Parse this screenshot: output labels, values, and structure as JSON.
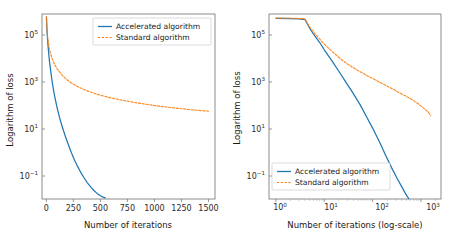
{
  "figure": {
    "background_color": "#ffffff",
    "width": 453,
    "height": 244,
    "panel_count": 2
  },
  "colors": {
    "accelerated": "#1f77b4",
    "standard": "#ff7f0e",
    "axis": "#7f7f7f",
    "text": "#1a1a1a"
  },
  "chart_data": [
    {
      "type": "line",
      "panel": "left",
      "title": "",
      "xlabel": "Number of iterations",
      "ylabel": "Logarithm of loss",
      "xscale": "linear",
      "yscale": "log",
      "xlim": [
        -40,
        1560
      ],
      "ylim": [
        0.012,
        1200000
      ],
      "xticks": [
        0,
        250,
        500,
        750,
        1000,
        1250,
        1500
      ],
      "xticklabels": [
        "0",
        "250",
        "500",
        "750",
        "1000",
        "1250",
        "1500"
      ],
      "yticks": [
        100000,
        1000,
        10,
        0.1
      ],
      "yticklabels": [
        "10^5",
        "10^3",
        "10^1",
        "10^-1"
      ],
      "grid": false,
      "legend_position": "upper right",
      "series": [
        {
          "name": "Accelerated algorithm",
          "style": "solid",
          "color": "#1f77b4",
          "x": [
            1,
            5,
            10,
            15,
            20,
            25,
            30,
            40,
            50,
            65,
            80,
            100,
            125,
            150,
            175,
            200,
            230,
            260,
            290,
            320,
            350,
            380,
            410,
            440,
            470,
            500,
            525,
            545
          ],
          "y": [
            900000,
            300000,
            120000,
            58000,
            30000,
            17000,
            10000,
            4200,
            1900,
            680,
            280,
            105,
            36,
            14.5,
            6.4,
            3.0,
            1.25,
            0.58,
            0.3,
            0.165,
            0.097,
            0.06,
            0.04,
            0.028,
            0.021,
            0.0165,
            0.0145,
            0.0135
          ]
        },
        {
          "name": "Standard algorithm",
          "style": "dashed",
          "color": "#ff7f0e",
          "x": [
            1,
            5,
            10,
            20,
            30,
            50,
            75,
            100,
            150,
            200,
            250,
            300,
            400,
            500,
            600,
            700,
            800,
            900,
            1000,
            1100,
            1200,
            1300,
            1400,
            1500
          ],
          "y": [
            900000,
            300000,
            145000,
            62000,
            34000,
            16000,
            8200,
            5100,
            2600,
            1600,
            1100,
            820,
            520,
            370,
            280,
            225,
            185,
            155,
            133,
            116,
            102,
            91,
            82,
            75
          ]
        }
      ]
    },
    {
      "type": "line",
      "panel": "right",
      "title": "",
      "xlabel": "Number of iterations (log-scale)",
      "ylabel": "Logarithm of loss",
      "xscale": "log",
      "yscale": "log",
      "xlim": [
        0.72,
        2600
      ],
      "ylim": [
        0.012,
        1200000
      ],
      "xticks": [
        1,
        10,
        100,
        1000
      ],
      "xticklabels": [
        "10^0",
        "10^1",
        "10^2",
        "10^3"
      ],
      "yticks": [
        100000,
        1000,
        10,
        0.1
      ],
      "yticklabels": [
        "10^5",
        "10^3",
        "10^1",
        "10^-1"
      ],
      "grid": false,
      "legend_position": "lower left",
      "series": [
        {
          "name": "Accelerated algorithm",
          "style": "solid",
          "color": "#1f77b4",
          "x": [
            1,
            2,
            3,
            4,
            5,
            6,
            8,
            10,
            14,
            20,
            28,
            40,
            55,
            75,
            100,
            140,
            190,
            250,
            320,
            400,
            470,
            520,
            560
          ],
          "y": [
            780000,
            760000,
            730000,
            690000,
            290000,
            160000,
            72000,
            34000,
            12500,
            4000,
            1350,
            430,
            145,
            43,
            14,
            3.4,
            0.85,
            0.26,
            0.095,
            0.041,
            0.022,
            0.0155,
            0.0125
          ]
        },
        {
          "name": "Standard algorithm",
          "style": "dashed",
          "color": "#ff7f0e",
          "x": [
            1,
            2,
            3,
            4,
            5,
            6,
            8,
            10,
            15,
            22,
            32,
            48,
            70,
            100,
            150,
            220,
            320,
            470,
            700,
            1000,
            1400,
            1600
          ],
          "y": [
            800000,
            790000,
            770000,
            740000,
            330000,
            200000,
            100000,
            60000,
            27000,
            13500,
            7600,
            4500,
            2900,
            1950,
            1250,
            830,
            540,
            350,
            218,
            128,
            70,
            48
          ]
        }
      ]
    }
  ],
  "panels": {
    "left": {
      "legend": {
        "items": [
          {
            "label": "Accelerated algorithm",
            "style": "solid",
            "color": "#1f77b4"
          },
          {
            "label": "Standard algorithm",
            "style": "dashed",
            "color": "#ff7f0e"
          }
        ]
      },
      "xlabel": "Number of iterations",
      "ylabel": "Logarithm of loss",
      "xticklabels": [
        "0",
        "250",
        "500",
        "750",
        "1000",
        "1250",
        "1500"
      ],
      "ytick_bases": [
        "10",
        "10",
        "10",
        "10"
      ],
      "ytick_exponents": [
        "5",
        "3",
        "1",
        "−1"
      ]
    },
    "right": {
      "legend": {
        "items": [
          {
            "label": "Accelerated algorithm",
            "style": "solid",
            "color": "#1f77b4"
          },
          {
            "label": "Standard algorithm",
            "style": "dashed",
            "color": "#ff7f0e"
          }
        ]
      },
      "xlabel": "Number of iterations (log-scale)",
      "ylabel": "Logarithm of loss",
      "xtick_bases": [
        "10",
        "10",
        "10",
        "10"
      ],
      "xtick_exponents": [
        "0",
        "1",
        "2",
        "3"
      ],
      "ytick_bases": [
        "10",
        "10",
        "10",
        "10"
      ],
      "ytick_exponents": [
        "5",
        "3",
        "1",
        "−1"
      ]
    }
  }
}
